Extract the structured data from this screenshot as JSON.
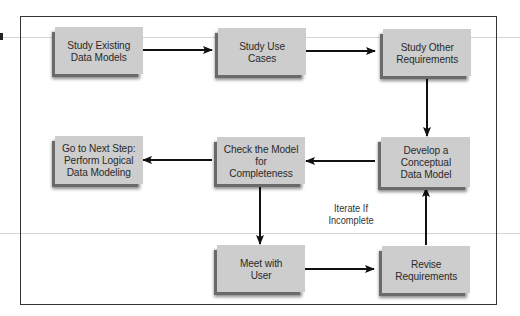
{
  "diagram": {
    "type": "flowchart",
    "colors": {
      "box_fill": "#cdcdcd",
      "box_shadow": "#6a6a6a",
      "line": "#111111",
      "frame": "#333333"
    },
    "nodes": [
      {
        "id": "study-existing",
        "label": "Study Existing\nData Models"
      },
      {
        "id": "study-use-cases",
        "label": "Study Use\nCases"
      },
      {
        "id": "study-other",
        "label": "Study Other\nRequirements"
      },
      {
        "id": "develop-conceptual",
        "label": "Develop a\nConceptual\nData Model"
      },
      {
        "id": "check-model",
        "label": "Check the Model\nfor Completeness"
      },
      {
        "id": "next-step",
        "label": "Go to Next Step:\nPerform Logical\nData Modeling"
      },
      {
        "id": "meet-user",
        "label": "Meet with\nUser"
      },
      {
        "id": "revise-req",
        "label": "Revise\nRequirements"
      }
    ],
    "edges": [
      {
        "from": "study-existing",
        "to": "study-use-cases"
      },
      {
        "from": "study-use-cases",
        "to": "study-other"
      },
      {
        "from": "study-other",
        "to": "develop-conceptual"
      },
      {
        "from": "develop-conceptual",
        "to": "check-model"
      },
      {
        "from": "check-model",
        "to": "next-step"
      },
      {
        "from": "check-model",
        "to": "meet-user"
      },
      {
        "from": "meet-user",
        "to": "revise-req"
      },
      {
        "from": "revise-req",
        "to": "develop-conceptual"
      }
    ],
    "annotation": "Iterate If\nIncomplete"
  }
}
